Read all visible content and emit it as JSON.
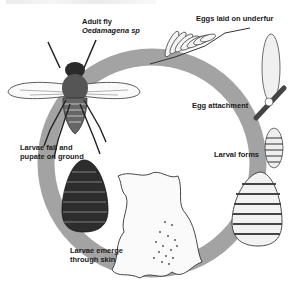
{
  "diagram": {
    "type": "life-cycle",
    "ring_color": "#a3a3a3",
    "stages": [
      {
        "id": "adult",
        "label_line1": "Adult fly",
        "label_line2": "Oedamagena sp"
      },
      {
        "id": "eggs",
        "label": "Eggs laid on underfur"
      },
      {
        "id": "attachment",
        "label": "Egg attachment"
      },
      {
        "id": "larval",
        "label": "Larval forms"
      },
      {
        "id": "emerge",
        "label_line1": "Larvae emerge",
        "label_line2": "through skin"
      },
      {
        "id": "pupate",
        "label_line1": "Larvae fall and",
        "label_line2": "pupate on ground"
      }
    ]
  }
}
